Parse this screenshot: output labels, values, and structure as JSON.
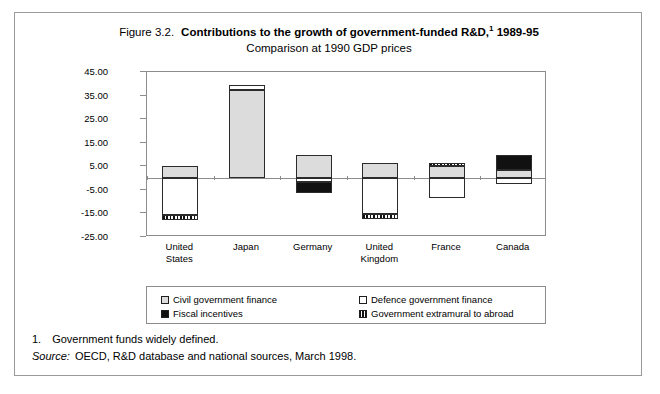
{
  "figure": {
    "number": "Figure 3.2.",
    "title": "Contributions to the growth of government-funded R&D,",
    "title_footnote_marker": "1",
    "title_period": " 1989-95",
    "subtitle": "Comparison at 1990 GDP prices"
  },
  "notes": {
    "footnote_number": "1.",
    "footnote_text": "Government funds widely defined.",
    "source_label": "Source:",
    "source_text": "OECD, R&D database and national sources, March 1998."
  },
  "legend": {
    "items": [
      {
        "label": "Civil government finance",
        "key": "civil",
        "color": "#dcdcdc"
      },
      {
        "label": "Defence government finance",
        "key": "defence",
        "color": "#ffffff"
      },
      {
        "label": "Fiscal incentives",
        "key": "fiscal",
        "color": "#111111"
      },
      {
        "label": "Government extramural to abroad",
        "key": "extramural",
        "color": "#ffffff"
      }
    ]
  },
  "chart_data": {
    "type": "bar",
    "stacked": true,
    "subtitle": "Comparison at 1990 GDP prices",
    "xlabel": "",
    "ylabel": "",
    "ylim": [
      -25,
      45
    ],
    "yticks": [
      45,
      35,
      25,
      15,
      5,
      -5,
      -15,
      -25
    ],
    "ytick_labels": [
      "45.00",
      "35.00",
      "25.00",
      "15.00",
      "5.00",
      "-5.00",
      "-15.00",
      "-25.00"
    ],
    "grid": false,
    "legend_position": "bottom",
    "categories": [
      "United States",
      "Japan",
      "Germany",
      "United Kingdom",
      "France",
      "Canada"
    ],
    "category_label_lines": [
      [
        "United",
        "States"
      ],
      [
        "Japan"
      ],
      [
        "Germany"
      ],
      [
        "United",
        "Kingdom"
      ],
      [
        "France"
      ],
      [
        "Canada"
      ]
    ],
    "series": [
      {
        "name": "Civil government finance",
        "key": "civil",
        "values": [
          5.3,
          37.5,
          10.0,
          6.5,
          5.0,
          3.5
        ]
      },
      {
        "name": "Defence government finance",
        "key": "defence",
        "values": [
          -16.0,
          2.0,
          -1.5,
          -15.5,
          -8.5,
          -2.5
        ]
      },
      {
        "name": "Fiscal incentives",
        "key": "fiscal",
        "values": [
          0,
          0,
          -4.5,
          0,
          0,
          6.5
        ]
      },
      {
        "name": "Government extramural to abroad",
        "key": "extramural",
        "values": [
          -2.0,
          0,
          0,
          -2.0,
          1.0,
          0
        ]
      }
    ],
    "stack_order": {
      "United States": [
        {
          "key": "civil",
          "from": 0,
          "to": 5.3
        },
        {
          "key": "defence",
          "from": 0,
          "to": -15.8
        },
        {
          "key": "extramural",
          "from": -15.8,
          "to": -17.8
        }
      ],
      "Japan": [
        {
          "key": "civil",
          "from": 0,
          "to": 37.5
        },
        {
          "key": "defence",
          "from": 37.5,
          "to": 39.5
        }
      ],
      "Germany": [
        {
          "key": "civil",
          "from": 0,
          "to": 10.0
        },
        {
          "key": "defence",
          "from": 0,
          "to": -1.6
        },
        {
          "key": "fiscal",
          "from": -1.6,
          "to": -6.2
        }
      ],
      "United Kingdom": [
        {
          "key": "civil",
          "from": 0,
          "to": 6.6
        },
        {
          "key": "defence",
          "from": 0,
          "to": -15.4
        },
        {
          "key": "extramural",
          "from": -15.4,
          "to": -17.4
        }
      ],
      "France": [
        {
          "key": "civil",
          "from": 0,
          "to": 5.0
        },
        {
          "key": "extramural",
          "from": 5.0,
          "to": 6.2
        },
        {
          "key": "defence",
          "from": 0,
          "to": -8.4
        }
      ],
      "Canada": [
        {
          "key": "fiscal",
          "from": 3.6,
          "to": 10.0
        },
        {
          "key": "civil",
          "from": 0,
          "to": 3.6
        },
        {
          "key": "defence",
          "from": 0,
          "to": -2.6
        }
      ]
    }
  }
}
